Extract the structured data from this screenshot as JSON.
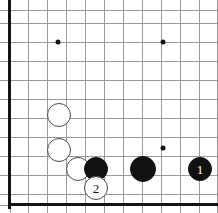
{
  "diagram": {
    "type": "go-board-corner",
    "board": {
      "width": 218,
      "height": 213,
      "grid_spacing": 19.2,
      "origin_x": 9.5,
      "origin_y": 206,
      "line_color": "#9a9a9a",
      "border_color": "#141414",
      "background_color": "#ffffff"
    },
    "grid": {
      "vertical_x": [
        9.5,
        28,
        47,
        66,
        85,
        104,
        123,
        142,
        161,
        180,
        199,
        217
      ],
      "horizontal_y": [
        10,
        23,
        42,
        61,
        80,
        99,
        118,
        137,
        156,
        175,
        194,
        205
      ]
    },
    "star_points": [
      {
        "name": "star-point-upper-left",
        "x": 58,
        "y": 42
      },
      {
        "name": "star-point-upper-right",
        "x": 163,
        "y": 42
      },
      {
        "name": "star-point-lower-right",
        "x": 163,
        "y": 148
      }
    ],
    "stones": [
      {
        "id": "white-stone-upper",
        "color": "white",
        "x": 59,
        "y": 115,
        "radius": 12,
        "label": ""
      },
      {
        "id": "white-stone-middle",
        "color": "white",
        "x": 59,
        "y": 150,
        "radius": 12,
        "label": ""
      },
      {
        "id": "white-stone-lower",
        "color": "white",
        "x": 78,
        "y": 169,
        "radius": 12,
        "label": ""
      },
      {
        "id": "black-stone-contact",
        "color": "black",
        "x": 96,
        "y": 169,
        "radius": 12,
        "label": ""
      },
      {
        "id": "black-stone-center",
        "color": "black",
        "x": 143,
        "y": 169,
        "radius": 13,
        "label": ""
      },
      {
        "id": "black-stone-move-1",
        "color": "black",
        "x": 200,
        "y": 169,
        "radius": 12,
        "label": "1"
      },
      {
        "id": "white-stone-move-2",
        "color": "white",
        "x": 96,
        "y": 188,
        "radius": 12,
        "label": "2"
      }
    ],
    "move_labels": {
      "black_move": "1",
      "white_move": "2"
    },
    "colors": {
      "black_stone": "#111111",
      "white_stone": "#ffffff",
      "white_stone_outline": "#4a4a4a",
      "grid": "#9a9a9a",
      "border": "#141414"
    }
  }
}
